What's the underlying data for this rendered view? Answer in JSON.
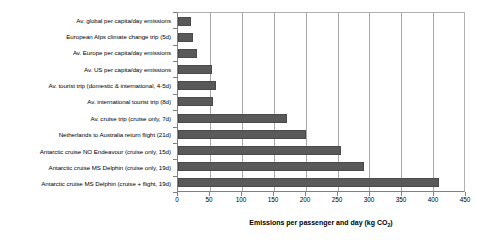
{
  "chart_data": {
    "type": "bar",
    "orientation": "horizontal",
    "title": "",
    "xlabel": "Emissions per passenger and day (kg CO2)",
    "xlabel_prefix": "Emissions per passenger and day (kg CO",
    "xlabel_sub": "2",
    "xlabel_suffix": ")",
    "ylabel": "",
    "xlim": [
      0,
      450
    ],
    "xticks": [
      0,
      50,
      100,
      150,
      200,
      250,
      300,
      350,
      400,
      450
    ],
    "xtick_labels": [
      "0",
      "50",
      "100",
      "150",
      "200",
      "250",
      "300",
      "350",
      "400",
      "450"
    ],
    "grid": true,
    "legend": false,
    "bar_color": "#595959",
    "categories": [
      "Av. global per capita/day emissions",
      "European Alps climate change trip (5d)",
      "Av. Europe per capita/day emissions",
      "Av. US per capita/day emissions",
      "Av. tourist trip (domestic & international, 4-5d)",
      "Av. international tourist trip (8d)",
      "Av. cruise trip (cruise only, 7d)",
      "Netherlands to Australia return flight (21d)",
      "Antarctic cruise NO Endeavour (cruise only, 15d)",
      "Antarctic cruise MS Delphin (cruise only, 19d)",
      "Antarctic cruise MS Delphin (cruise + flight, 19d)"
    ],
    "values": [
      20,
      23,
      30,
      53,
      60,
      55,
      170,
      200,
      255,
      290,
      408
    ]
  }
}
